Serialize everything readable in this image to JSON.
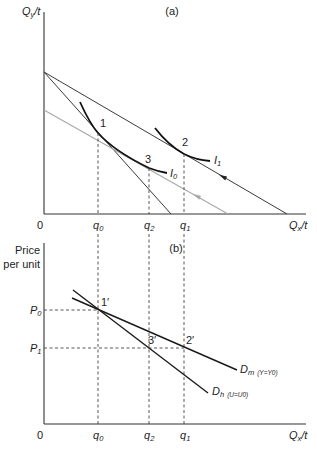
{
  "panel_a": {
    "title": "(a)",
    "y_axis": {
      "base": "Q",
      "sub": "y",
      "rest": "/t"
    },
    "x_axis": {
      "base": "Q",
      "sub": "x",
      "rest": "/t"
    },
    "origin": "0",
    "ticks": [
      {
        "base": "q",
        "sub": "0"
      },
      {
        "base": "q",
        "sub": "2"
      },
      {
        "base": "q",
        "sub": "1"
      }
    ],
    "points": [
      "1",
      "2",
      "3"
    ],
    "indifference_curves": [
      {
        "base": "I",
        "sub": "0"
      },
      {
        "base": "I",
        "sub": "1"
      }
    ],
    "colors": {
      "budget": "#3a3a3a",
      "compensated_budget": "#a8a8a8",
      "curves": "#111111"
    }
  },
  "panel_b": {
    "title": "(b)",
    "y_axis": {
      "line1": "Price",
      "line2": "per unit"
    },
    "x_axis": {
      "base": "Q",
      "sub": "x",
      "rest": "/t"
    },
    "origin": "0",
    "ticks": [
      {
        "base": "q",
        "sub": "0"
      },
      {
        "base": "q",
        "sub": "2"
      },
      {
        "base": "q",
        "sub": "1"
      }
    ],
    "prices": [
      {
        "base": "P",
        "sub": "0"
      },
      {
        "base": "P",
        "sub": "1"
      }
    ],
    "points": [
      "1′",
      "2′",
      "3′"
    ],
    "demand_curves": [
      {
        "base": "D",
        "sub": "m",
        "cond": "(Y=Y0)"
      },
      {
        "base": "D",
        "sub": "h",
        "cond": "(U=U0)"
      }
    ]
  }
}
